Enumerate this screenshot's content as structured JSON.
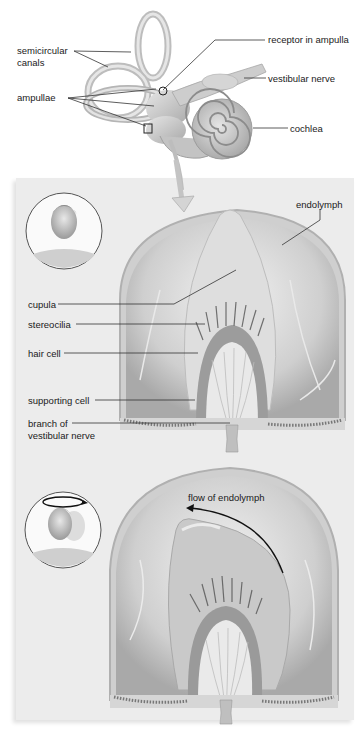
{
  "figure": {
    "top_section": {
      "title": "inner ear overview",
      "labels": {
        "semicircular_1": "semicircular",
        "semicircular_2": "canals",
        "ampullae": "ampullae",
        "receptor": "receptor in ampulla",
        "vestibular_nerve": "vestibular nerve",
        "cochlea": "cochlea"
      }
    },
    "middle_panel": {
      "state": "head at rest",
      "labels": {
        "endolymph": "endolymph",
        "cupula": "cupula",
        "stereocilia": "stereocilia",
        "hair_cell": "hair cell",
        "supporting_cell": "supporting cell",
        "branch_1": "branch of",
        "branch_2": "vestibular nerve"
      }
    },
    "bottom_panel": {
      "state": "head rotating",
      "labels": {
        "flow": "flow of endolymph"
      }
    },
    "colors": {
      "background": "#ffffff",
      "panel": "#ececec",
      "tissue_light": "#d9d9d9",
      "tissue_mid": "#b5b5b5",
      "tissue_dark": "#7a7a7a",
      "leader_line": "#333333"
    }
  }
}
